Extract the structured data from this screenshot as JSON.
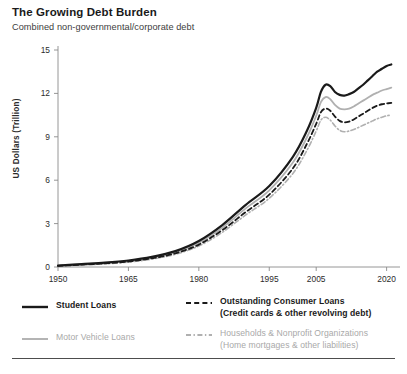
{
  "header": {
    "title": "The Growing Debt Burden",
    "subtitle": "Combined non-governmental/corporate debt"
  },
  "axes": {
    "ylabel": "US Dollars (Trillion)",
    "yticks": [
      "0",
      "3",
      "6",
      "9",
      "12",
      "15"
    ],
    "xticks": [
      "1950",
      "1965",
      "1980",
      "1995",
      "2005",
      "2020"
    ]
  },
  "legend": {
    "student_loans": "Student Loans",
    "consumer_loans_line1": "Outstanding Consumer Loans",
    "consumer_loans_line2": "(Credit cards & other revolving debt)",
    "motor_vehicle": "Motor Vehicle Loans",
    "households_line1": "Households & Nonprofit Organizations",
    "households_line2": "(Home mortgages & other liabilities)"
  },
  "colors": {
    "dark": "#1a1a1a",
    "light": "#b0b0b0",
    "axis": "#8a8a8a",
    "text": "#2b2b2b"
  },
  "chart_data": {
    "type": "line",
    "title": "The Growing Debt Burden",
    "subtitle": "Combined non-governmental/corporate debt",
    "xlabel": "",
    "ylabel": "US Dollars (Trillion)",
    "xlim": [
      1950,
      2022
    ],
    "ylim": [
      0,
      15
    ],
    "yticks": [
      0,
      3,
      6,
      9,
      12,
      15
    ],
    "xticks": [
      1950,
      1965,
      1980,
      1995,
      2005,
      2020
    ],
    "grid": false,
    "legend_position": "below-plot",
    "x": [
      1950,
      1955,
      1960,
      1965,
      1970,
      1975,
      1980,
      1985,
      1990,
      1995,
      2000,
      2003,
      2005,
      2006,
      2007,
      2008,
      2009,
      2010,
      2011,
      2012,
      2013,
      2014,
      2015,
      2016,
      2017,
      2018,
      2019,
      2020,
      2021
    ],
    "series": [
      {
        "name": "Student Loans",
        "style": "solid",
        "color": "#1a1a1a",
        "width": 2.2,
        "values": [
          0.1,
          0.2,
          0.3,
          0.45,
          0.7,
          1.1,
          1.8,
          2.9,
          4.3,
          5.6,
          7.6,
          9.4,
          11.0,
          12.1,
          12.6,
          12.5,
          12.1,
          11.9,
          11.85,
          11.95,
          12.1,
          12.35,
          12.6,
          12.9,
          13.2,
          13.5,
          13.7,
          13.9,
          14.0
        ]
      },
      {
        "name": "Outstanding Consumer Loans (Credit cards & other revolving debt)",
        "style": "dashed",
        "color": "#1a1a1a",
        "width": 1.8,
        "values": [
          0.08,
          0.16,
          0.25,
          0.38,
          0.6,
          0.95,
          1.55,
          2.55,
          3.8,
          5.0,
          6.8,
          8.5,
          9.9,
          10.7,
          10.95,
          10.8,
          10.4,
          10.1,
          10.0,
          10.05,
          10.2,
          10.4,
          10.6,
          10.8,
          11.0,
          11.15,
          11.25,
          11.3,
          11.35
        ]
      },
      {
        "name": "Motor Vehicle Loans",
        "style": "solid",
        "color": "#b0b0b0",
        "width": 1.8,
        "values": [
          0.09,
          0.18,
          0.28,
          0.42,
          0.65,
          1.02,
          1.68,
          2.72,
          4.05,
          5.3,
          7.2,
          8.95,
          10.45,
          11.4,
          11.75,
          11.6,
          11.2,
          10.95,
          10.9,
          10.95,
          11.1,
          11.3,
          11.5,
          11.7,
          11.9,
          12.05,
          12.2,
          12.3,
          12.4
        ]
      },
      {
        "name": "Households & Nonprofit Organizations (Home mortgages & other liabilities)",
        "style": "dashdot",
        "color": "#b0b0b0",
        "width": 1.6,
        "values": [
          0.07,
          0.14,
          0.22,
          0.34,
          0.55,
          0.88,
          1.45,
          2.4,
          3.6,
          4.75,
          6.45,
          8.05,
          9.4,
          10.15,
          10.35,
          10.15,
          9.75,
          9.45,
          9.35,
          9.4,
          9.5,
          9.65,
          9.8,
          9.95,
          10.1,
          10.25,
          10.35,
          10.45,
          10.5
        ]
      }
    ]
  }
}
